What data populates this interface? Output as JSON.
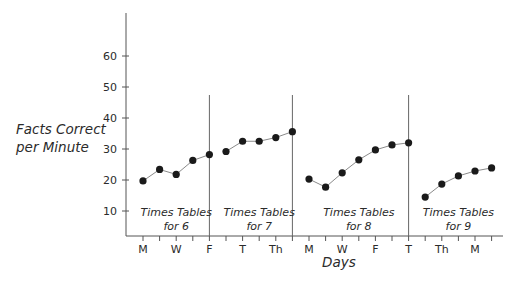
{
  "chart_data": {
    "type": "line",
    "title": "",
    "xlabel": "Days",
    "ylabel": "Facts Correct per Minute",
    "ylabel_lines": [
      "Facts Correct",
      "per Minute"
    ],
    "ylim": [
      0,
      70
    ],
    "yticks": [
      10,
      20,
      30,
      40,
      50,
      60
    ],
    "grid": false,
    "legend": null,
    "x_tick_count": 22,
    "x_tick_labels": [
      {
        "index": 0,
        "label": "M"
      },
      {
        "index": 2,
        "label": "W"
      },
      {
        "index": 4,
        "label": "F"
      },
      {
        "index": 6,
        "label": "T"
      },
      {
        "index": 8,
        "label": "Th"
      },
      {
        "index": 10,
        "label": "M"
      },
      {
        "index": 12,
        "label": "W"
      },
      {
        "index": 14,
        "label": "F"
      },
      {
        "index": 16,
        "label": "T"
      },
      {
        "index": 18,
        "label": "Th"
      },
      {
        "index": 20,
        "label": "M"
      }
    ],
    "phase_dividers_after_index": [
      4,
      9,
      16
    ],
    "series": [
      {
        "name": "Times Tables for 6",
        "label_lines": [
          "Times Tables",
          "for 6"
        ],
        "x": [
          0,
          1,
          2,
          3,
          4
        ],
        "values": [
          19.7,
          23.4,
          21.8,
          26.3,
          28.2
        ]
      },
      {
        "name": "Times Tables for 7",
        "label_lines": [
          "Times Tables",
          "for 7"
        ],
        "x": [
          5,
          6,
          7,
          8,
          9
        ],
        "values": [
          29.2,
          32.5,
          32.5,
          33.7,
          35.6
        ]
      },
      {
        "name": "Times Tables for 8",
        "label_lines": [
          "Times Tables",
          "for 8"
        ],
        "x": [
          10,
          11,
          12,
          13,
          14,
          15,
          16
        ],
        "values": [
          20.3,
          17.7,
          22.3,
          26.5,
          29.7,
          31.3,
          32.0
        ]
      },
      {
        "name": "Times Tables for 9",
        "label_lines": [
          "Times Tables",
          "for 9"
        ],
        "x": [
          17,
          18,
          19,
          20,
          21
        ],
        "values": [
          14.5,
          18.7,
          21.3,
          22.9,
          23.9
        ]
      }
    ],
    "colors": {
      "line": "#8a8a8a",
      "point": "#1a1a1a",
      "axis": "#555555",
      "text": "#2b2b2b"
    }
  }
}
